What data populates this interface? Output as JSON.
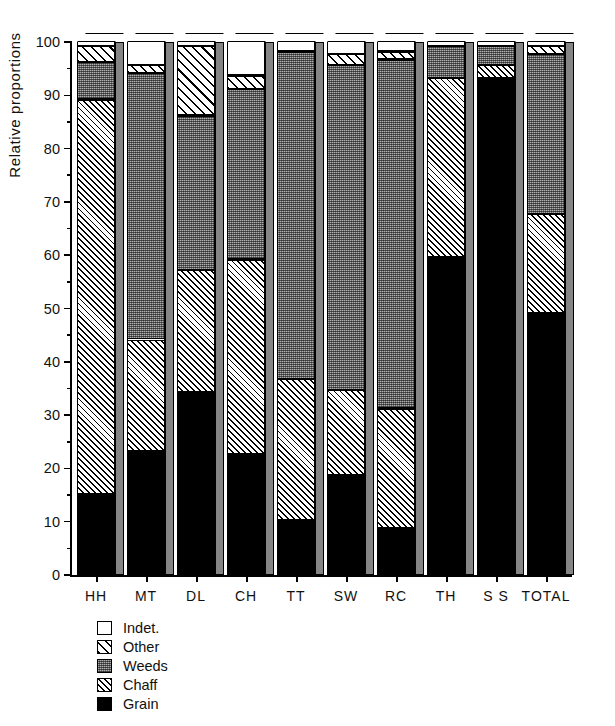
{
  "chart_data": {
    "type": "bar",
    "subtype": "stacked-bar-100-percent-3d",
    "title": "",
    "xlabel": "",
    "ylabel": "Relative proportions",
    "ylim": [
      0,
      100
    ],
    "yticks": [
      0,
      10,
      20,
      30,
      40,
      50,
      60,
      70,
      80,
      90,
      100
    ],
    "ytick_labels": [
      "0",
      "10",
      "20",
      "30",
      "40",
      "50",
      "60",
      "70",
      "80",
      "90",
      "100"
    ],
    "yminor_ticks": [
      5,
      15,
      25,
      35,
      45,
      55,
      65,
      75,
      85,
      95
    ],
    "grid": false,
    "legend_position": "below-axes-left",
    "categories": [
      "HH",
      "MT",
      "DL",
      "CH",
      "TT",
      "SW",
      "RC",
      "TH",
      "S S",
      "TOTAL"
    ],
    "series": [
      {
        "name": "Grain",
        "fill": "solid-black",
        "values": [
          15.0,
          23.0,
          34.0,
          22.5,
          10.0,
          18.5,
          8.5,
          59.5,
          93.0,
          49.0
        ]
      },
      {
        "name": "Chaff",
        "fill": "diagonal-hatch",
        "values": [
          74.0,
          21.0,
          23.0,
          36.5,
          26.5,
          16.0,
          22.5,
          33.5,
          2.5,
          18.5
        ]
      },
      {
        "name": "Weeds",
        "fill": "grey-stipple",
        "values": [
          7.0,
          50.0,
          29.0,
          32.0,
          61.5,
          61.0,
          65.5,
          6.0,
          3.5,
          30.0
        ]
      },
      {
        "name": "Other",
        "fill": "wide-hatch",
        "values": [
          3.0,
          1.5,
          13.0,
          2.5,
          0.0,
          2.0,
          1.5,
          0.0,
          0.0,
          1.5
        ]
      },
      {
        "name": "Indet.",
        "fill": "white",
        "values": [
          1.0,
          4.5,
          1.0,
          6.5,
          2.0,
          2.5,
          2.0,
          1.0,
          1.0,
          1.0
        ]
      }
    ],
    "cumulative_tops": {
      "HH": {
        "grain": 15.0,
        "chaff": 89.0,
        "weeds": 96.0,
        "other": 99.0,
        "indet": 100
      },
      "MT": {
        "grain": 23.0,
        "chaff": 44.0,
        "weeds": 94.0,
        "other": 95.5,
        "indet": 100
      },
      "DL": {
        "grain": 34.0,
        "chaff": 57.0,
        "weeds": 86.0,
        "other": 99.0,
        "indet": 100
      },
      "CH": {
        "grain": 22.5,
        "chaff": 59.0,
        "weeds": 91.0,
        "other": 93.5,
        "indet": 100
      },
      "TT": {
        "grain": 10.0,
        "chaff": 36.5,
        "weeds": 98.0,
        "other": 98.0,
        "indet": 100
      },
      "SW": {
        "grain": 18.5,
        "chaff": 34.5,
        "weeds": 95.5,
        "other": 97.5,
        "indet": 100
      },
      "RC": {
        "grain": 8.5,
        "chaff": 31.0,
        "weeds": 96.5,
        "other": 98.0,
        "indet": 100
      },
      "TH": {
        "grain": 59.5,
        "chaff": 93.0,
        "weeds": 99.0,
        "other": 99.0,
        "indet": 100
      },
      "S S": {
        "grain": 93.0,
        "chaff": 95.5,
        "weeds": 99.0,
        "other": 99.0,
        "indet": 100
      },
      "TOTAL": {
        "grain": 49.0,
        "chaff": 67.5,
        "weeds": 97.5,
        "other": 99.0,
        "indet": 100
      }
    }
  },
  "axis": {
    "y_title": "Relative proportions",
    "y_labels": [
      "100",
      "90",
      "80",
      "70",
      "60",
      "50",
      "40",
      "30",
      "20",
      "10",
      "0"
    ],
    "x_labels": [
      "HH",
      "MT",
      "DL",
      "CH",
      "TT",
      "SW",
      "RC",
      "TH",
      "S S",
      "TOTAL"
    ]
  },
  "legend": {
    "items": [
      {
        "label": "Indet.",
        "key": "indet"
      },
      {
        "label": "Other",
        "key": "other"
      },
      {
        "label": "Weeds",
        "key": "weeds"
      },
      {
        "label": "Chaff",
        "key": "chaff"
      },
      {
        "label": "Grain",
        "key": "grain"
      }
    ]
  },
  "colors": {
    "grain": "#000000",
    "weeds": "#6e6e6e",
    "indet": "#ffffff",
    "outline": "#000000"
  }
}
